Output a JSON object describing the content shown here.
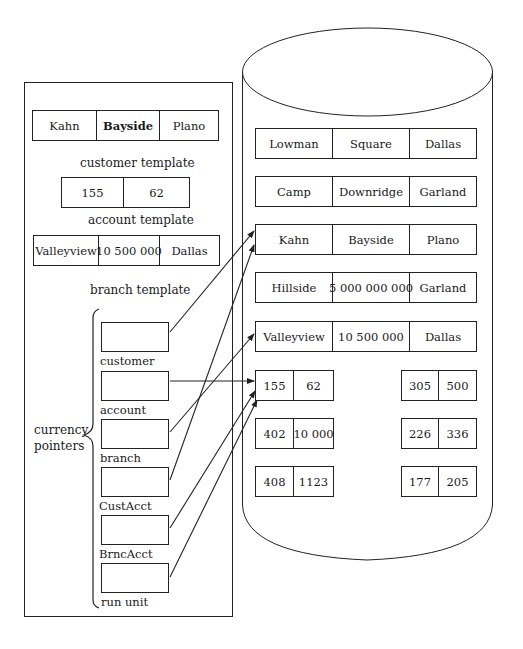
{
  "memory_panel": {
    "customer_template": {
      "cells": [
        "Kahn",
        "Bayside",
        "Plano"
      ],
      "label": "customer template"
    },
    "account_template": {
      "cells": [
        "155",
        "62"
      ],
      "label": "account template"
    },
    "branch_template": {
      "cells": [
        "Valleyview",
        "10 500 000",
        "Dallas"
      ],
      "label": "branch template"
    },
    "currency_pointers": {
      "label_line1": "currency",
      "label_line2": "pointers",
      "pointers": [
        {
          "label": "customer",
          "target": "Kahn / Bayside / Plano"
        },
        {
          "label": "account",
          "target": "155 / 62"
        },
        {
          "label": "branch",
          "target": "Valleyview / 10 500 000 / Dallas"
        },
        {
          "label": "CustAcct",
          "target": "Kahn / Bayside / Plano"
        },
        {
          "label": "BrncAcct",
          "target": "155 / 62"
        },
        {
          "label": "run unit",
          "target": "155 / 62"
        }
      ]
    }
  },
  "database": {
    "records": [
      [
        "Lowman",
        "Square",
        "Dallas"
      ],
      [
        "Camp",
        "Downridge",
        "Garland"
      ],
      [
        "Kahn",
        "Bayside",
        "Plano"
      ],
      [
        "Hillside",
        "5 000 000 000",
        "Garland"
      ],
      [
        "Valleyview",
        "10 500 000",
        "Dallas"
      ]
    ],
    "accounts_left": [
      [
        "155",
        "62"
      ],
      [
        "402",
        "10 000"
      ],
      [
        "408",
        "1123"
      ]
    ],
    "accounts_right": [
      [
        "305",
        "500"
      ],
      [
        "226",
        "336"
      ],
      [
        "177",
        "205"
      ]
    ]
  },
  "colors": {
    "line": "#222222",
    "background": "#ffffff"
  }
}
